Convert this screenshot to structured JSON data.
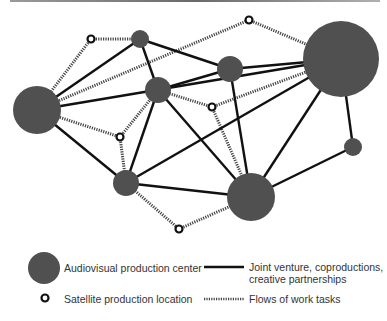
{
  "diagram": {
    "colors": {
      "center": "#505050",
      "edge": "#111111",
      "flow": "#444444",
      "satellite_stroke": "#111111"
    },
    "centers": [
      {
        "id": "c-left",
        "size": "large"
      },
      {
        "id": "c-top-small",
        "size": "small"
      },
      {
        "id": "c-mid",
        "size": "medium"
      },
      {
        "id": "c-top-right-mid",
        "size": "medium"
      },
      {
        "id": "c-far-right",
        "size": "xlarge"
      },
      {
        "id": "c-right-small",
        "size": "small"
      },
      {
        "id": "c-low-left",
        "size": "medium"
      },
      {
        "id": "c-bottom",
        "size": "large"
      }
    ],
    "satellites": [
      "s-top-left",
      "s-top",
      "s-mid",
      "s-left-mid",
      "s-bottom"
    ],
    "partnerships": [
      [
        "c-left",
        "c-top-small"
      ],
      [
        "c-left",
        "c-far-right"
      ],
      [
        "c-left",
        "c-low-left"
      ],
      [
        "c-top-small",
        "c-mid"
      ],
      [
        "c-top-small",
        "c-top-right-mid"
      ],
      [
        "c-mid",
        "c-top-right-mid"
      ],
      [
        "c-mid",
        "c-low-left"
      ],
      [
        "c-mid",
        "c-bottom"
      ],
      [
        "c-top-right-mid",
        "c-far-right"
      ],
      [
        "c-top-right-mid",
        "c-bottom"
      ],
      [
        "c-far-right",
        "c-low-left"
      ],
      [
        "c-far-right",
        "c-bottom"
      ],
      [
        "c-far-right",
        "c-right-small"
      ],
      [
        "c-right-small",
        "c-bottom"
      ],
      [
        "c-low-left",
        "c-bottom"
      ]
    ],
    "flows": [
      [
        "s-top-left",
        "c-left"
      ],
      [
        "s-top-left",
        "c-top-small"
      ],
      [
        "c-left",
        "s-top"
      ],
      [
        "s-top",
        "c-far-right"
      ],
      [
        "c-left",
        "s-left-mid"
      ],
      [
        "s-left-mid",
        "c-mid"
      ],
      [
        "s-left-mid",
        "c-low-left"
      ],
      [
        "c-mid",
        "s-mid"
      ],
      [
        "s-mid",
        "c-far-right"
      ],
      [
        "s-mid",
        "c-bottom"
      ],
      [
        "c-low-left",
        "s-bottom"
      ],
      [
        "s-bottom",
        "c-bottom"
      ]
    ]
  },
  "legend": {
    "center_label": "Audiovisual production center",
    "satellite_label": "Satellite production location",
    "partnership_label_line1": "Joint venture, coproductions,",
    "partnership_label_line2": "creative partnerships",
    "flow_label": "Flows of work tasks"
  }
}
